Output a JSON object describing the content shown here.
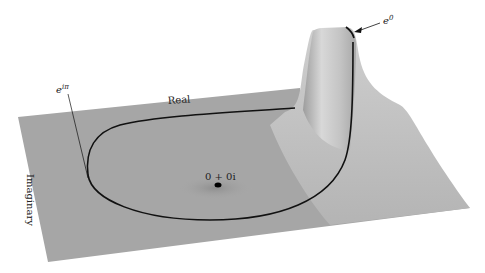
{
  "figure": {
    "type": "3d-surface-plot",
    "axis_labels": {
      "real": "Real",
      "imaginary": "Imaginary"
    },
    "annotations": {
      "e_i_pi": {
        "base": "e",
        "exponent": "iπ"
      },
      "e_zero": {
        "base": "e",
        "exponent": "0"
      },
      "origin": "0 + 0i"
    },
    "colors": {
      "surface": "#a6a6a6",
      "surface_highlight": "#d6d6d6",
      "path": "#111111",
      "background": "#ffffff"
    }
  }
}
